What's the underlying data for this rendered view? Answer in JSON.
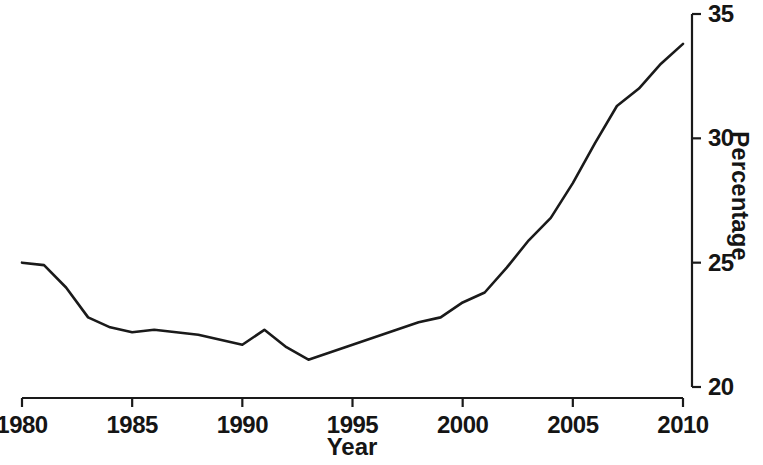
{
  "chart_data": {
    "type": "line",
    "title": "",
    "xlabel": "Year",
    "ylabel": "Percentage",
    "xlim": [
      1980,
      2010
    ],
    "ylim": [
      20,
      35
    ],
    "xticks": [
      1980,
      1985,
      1990,
      1995,
      2000,
      2005,
      2010
    ],
    "xtick_labels": [
      "1980",
      "1985",
      "1990",
      "1995",
      "2000",
      "2005",
      "2010"
    ],
    "yticks": [
      20,
      25,
      30,
      35
    ],
    "ytick_labels": [
      "20",
      "25",
      "30",
      "35"
    ],
    "y_axis_position": "right",
    "grid": false,
    "legend": null,
    "line_color": "#1a1a1a",
    "line_width": 2.6,
    "x": [
      1980,
      1981,
      1982,
      1983,
      1984,
      1985,
      1986,
      1987,
      1988,
      1989,
      1990,
      1991,
      1992,
      1993,
      1994,
      1995,
      1996,
      1997,
      1998,
      1999,
      2000,
      2001,
      2002,
      2003,
      2004,
      2005,
      2006,
      2007,
      2008,
      2009,
      2010
    ],
    "values": [
      25.0,
      24.9,
      24.0,
      22.8,
      22.4,
      22.2,
      22.3,
      22.2,
      22.1,
      21.9,
      21.7,
      22.3,
      21.6,
      21.1,
      21.4,
      21.7,
      22.0,
      22.3,
      22.6,
      22.8,
      23.4,
      23.8,
      24.8,
      25.9,
      26.8,
      28.2,
      29.8,
      31.3,
      32.0,
      33.0,
      33.8
    ],
    "series": [
      {
        "name": "Percentage",
        "values": [
          25.0,
          24.9,
          24.0,
          22.8,
          22.4,
          22.2,
          22.3,
          22.2,
          22.1,
          21.9,
          21.7,
          22.3,
          21.6,
          21.1,
          21.4,
          21.7,
          22.0,
          22.3,
          22.6,
          22.8,
          23.4,
          23.8,
          24.8,
          25.9,
          26.8,
          28.2,
          29.8,
          31.3,
          32.0,
          33.0,
          33.8
        ]
      }
    ],
    "annotations": []
  }
}
